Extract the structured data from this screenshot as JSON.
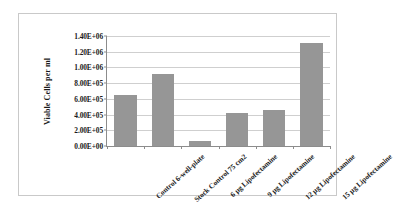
{
  "chart_data": {
    "type": "bar",
    "title": "",
    "subtitle": "",
    "xlabel": "",
    "ylabel": "Viable Cells per ml",
    "categories": [
      "Control 6-well-plate",
      "Stock Control 75 cm2",
      "6 µg Lipofectamine",
      "9 µg Lipofectamine",
      "12 µg Lipofectamine",
      "15 µg Lipofectamine"
    ],
    "values": [
      650000,
      920000,
      70000,
      425000,
      455000,
      1310000
    ],
    "ylim": [
      0,
      1400000
    ],
    "ytick_values": [
      0,
      200000,
      400000,
      600000,
      800000,
      1000000,
      1200000,
      1400000
    ],
    "ytick_labels": [
      "0.00E+00",
      "2.00E+05",
      "4.00E+05",
      "6.00E+05",
      "8.00E+05",
      "1.00E+06",
      "1.20E+06",
      "1.40E+06"
    ],
    "grid": true,
    "legend": false,
    "legend_position": "none",
    "bar_color": "#969696",
    "gridline_color": "#cfcfcf",
    "axis_color": "#8c8c8c",
    "frame_color": "#c9c9c9",
    "background_color": "#ffffff"
  }
}
